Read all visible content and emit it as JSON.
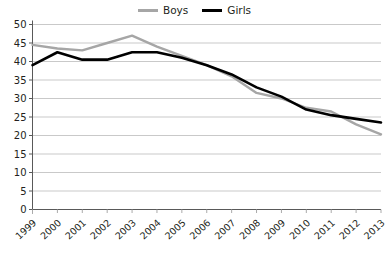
{
  "chart_data": {
    "type": "line",
    "title": "",
    "xlabel": "",
    "ylabel": "",
    "categories": [
      "1999",
      "2000",
      "2001",
      "2002",
      "2003",
      "2004",
      "2005",
      "2006",
      "2007",
      "2008",
      "2009",
      "2010",
      "2011",
      "2012",
      "2013"
    ],
    "ylim": [
      0,
      50
    ],
    "ytick_step": 5,
    "yticks": [
      "0",
      "5",
      "10",
      "15",
      "20",
      "25",
      "30",
      "35",
      "40",
      "45",
      "50"
    ],
    "grid": true,
    "grid_axis": "y",
    "legend_position": "top-center",
    "series": [
      {
        "name": "Boys",
        "color": "#a6a6a6",
        "values": [
          44.5,
          43.5,
          43.0,
          45.0,
          47.0,
          44.0,
          41.5,
          39.0,
          36.0,
          31.5,
          30.0,
          27.5,
          26.5,
          23.0,
          20.3
        ]
      },
      {
        "name": "Girls",
        "color": "#000000",
        "values": [
          39.0,
          42.5,
          40.5,
          40.5,
          42.5,
          42.5,
          41.0,
          39.0,
          36.5,
          33.0,
          30.5,
          27.0,
          25.5,
          24.5,
          23.5
        ]
      }
    ]
  },
  "legend": {
    "entries": [
      {
        "label": "Boys",
        "icon": "line-swatch-gray"
      },
      {
        "label": "Girls",
        "icon": "line-swatch-black"
      }
    ]
  }
}
